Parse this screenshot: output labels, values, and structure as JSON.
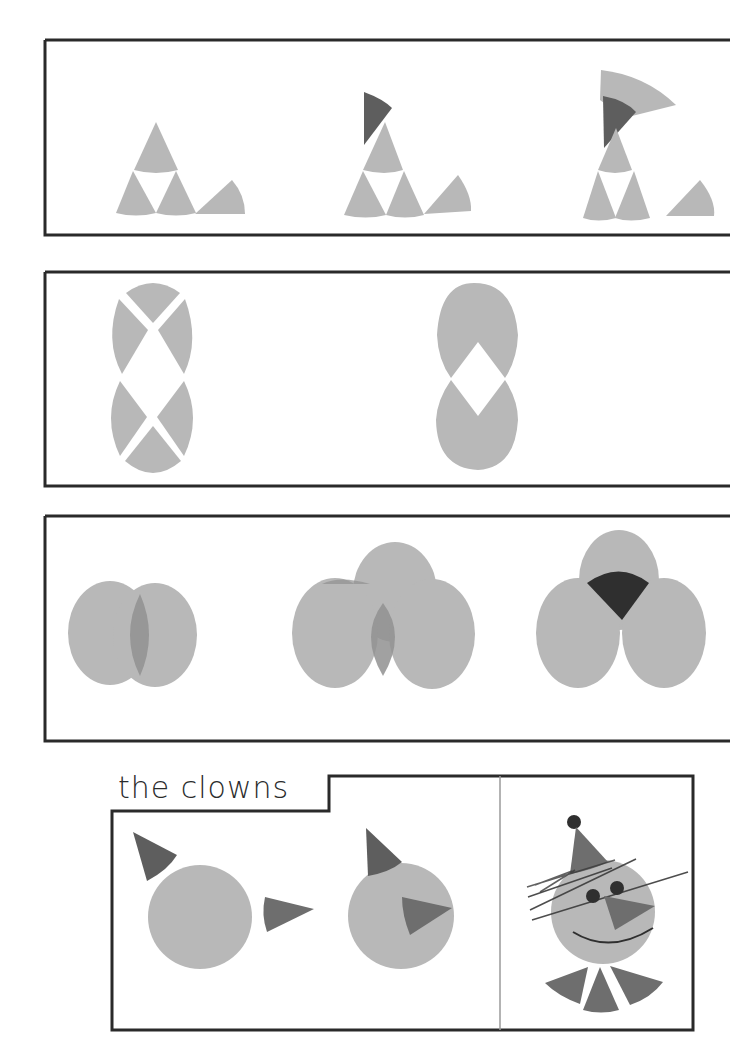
{
  "colors": {
    "light_gray": "#b8b8b8",
    "mid_gray": "#909090",
    "dark_gray": "#5e5e5e",
    "darker": "#2f2f2f",
    "border": "#2a2a2a",
    "background": "#ffffff"
  },
  "panels": [
    {
      "id": "panel-1",
      "description": "cone shapes forming a figure in three steps"
    },
    {
      "id": "panel-2",
      "description": "four-quarter circles forming two circles"
    },
    {
      "id": "panel-3",
      "description": "overlapping circles"
    },
    {
      "id": "panel-4",
      "description": "clowns"
    }
  ],
  "clowns_section": {
    "title": "the clowns"
  }
}
